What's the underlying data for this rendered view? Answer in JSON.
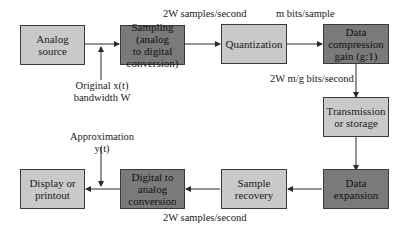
{
  "diagram": {
    "title": "",
    "nodes": [
      {
        "id": "analog-source",
        "label": "Analog\nsource",
        "shade": "light"
      },
      {
        "id": "sampling",
        "label": "Sampling\n(analog\nto digital\nconversion)",
        "shade": "dark"
      },
      {
        "id": "quantization",
        "label": "Quantization",
        "shade": "light"
      },
      {
        "id": "data-compression",
        "label": "Data\ncompression\ngain (g:1)",
        "shade": "dark"
      },
      {
        "id": "transmission",
        "label": "Transmission\nor storage",
        "shade": "light"
      },
      {
        "id": "data-expansion",
        "label": "Data\nexpansion",
        "shade": "dark"
      },
      {
        "id": "sample-recovery",
        "label": "Sample\nrecovery",
        "shade": "light"
      },
      {
        "id": "digital-to-analog",
        "label": "Digital to\nanalog\nconversion",
        "shade": "dark"
      },
      {
        "id": "display",
        "label": "Display or\nprintout",
        "shade": "light"
      }
    ],
    "edges": [
      {
        "from": "analog-source",
        "to": "sampling"
      },
      {
        "from": "sampling",
        "to": "quantization",
        "label": "2W samples/second"
      },
      {
        "from": "quantization",
        "to": "data-compression",
        "label": "m bits/sample"
      },
      {
        "from": "data-compression",
        "to": "transmission",
        "label": "2W m/g bits/second"
      },
      {
        "from": "transmission",
        "to": "data-expansion"
      },
      {
        "from": "data-expansion",
        "to": "sample-recovery"
      },
      {
        "from": "sample-recovery",
        "to": "digital-to-analog",
        "label": "2W samples/second"
      },
      {
        "from": "digital-to-analog",
        "to": "display"
      }
    ],
    "annotations": {
      "original_line1": "Original x(t)",
      "original_line2": "bandwidth W",
      "approx_line1": "Approximation",
      "approx_line2": "y(t)",
      "rate_top": "2W samples/second",
      "bits_per_sample": "m bits/sample",
      "compressed_rate": "2W m/g bits/second",
      "rate_bottom": "2W samples/second"
    },
    "colors": {
      "light_box": "#c9c9c9",
      "dark_box": "#7a7a7a",
      "line": "#2a2a2a"
    }
  }
}
